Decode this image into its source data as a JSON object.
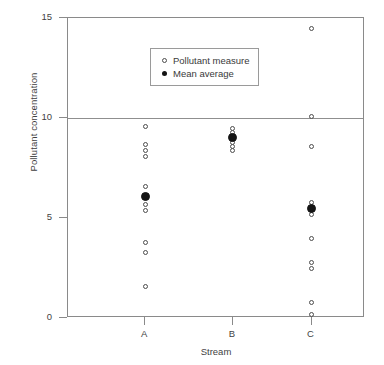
{
  "chart_data": {
    "type": "scatter",
    "title": "",
    "xlabel": "Stream",
    "ylabel": "Pollutant concentration",
    "categories": [
      "A",
      "B",
      "C"
    ],
    "yticks": [
      0,
      5,
      10,
      15
    ],
    "ylim": [
      0,
      15
    ],
    "grid": false,
    "reference_lines": [
      10
    ],
    "legend": {
      "position": "top-left-inside",
      "entries": [
        {
          "label": "Pollutant measure",
          "marker": "open-circle",
          "color": "#4c4c4c"
        },
        {
          "label": "Mean average",
          "marker": "filled-circle",
          "color": "#141414"
        }
      ]
    },
    "series": [
      {
        "name": "Pollutant measure",
        "marker": "open-circle",
        "points": [
          {
            "category": "A",
            "value": 9.6
          },
          {
            "category": "A",
            "value": 8.7
          },
          {
            "category": "A",
            "value": 8.4
          },
          {
            "category": "A",
            "value": 8.1
          },
          {
            "category": "A",
            "value": 6.6
          },
          {
            "category": "A",
            "value": 5.7
          },
          {
            "category": "A",
            "value": 5.4
          },
          {
            "category": "A",
            "value": 3.8
          },
          {
            "category": "A",
            "value": 3.3
          },
          {
            "category": "A",
            "value": 1.6
          },
          {
            "category": "B",
            "value": 9.5
          },
          {
            "category": "B",
            "value": 9.3
          },
          {
            "category": "B",
            "value": 9.1
          },
          {
            "category": "B",
            "value": 8.8
          },
          {
            "category": "B",
            "value": 8.6
          },
          {
            "category": "B",
            "value": 8.4
          },
          {
            "category": "C",
            "value": 14.5
          },
          {
            "category": "C",
            "value": 10.1
          },
          {
            "category": "C",
            "value": 8.6
          },
          {
            "category": "C",
            "value": 5.8
          },
          {
            "category": "C",
            "value": 5.2
          },
          {
            "category": "C",
            "value": 4.0
          },
          {
            "category": "C",
            "value": 2.8
          },
          {
            "category": "C",
            "value": 2.5
          },
          {
            "category": "C",
            "value": 0.8
          },
          {
            "category": "C",
            "value": 0.2
          }
        ]
      },
      {
        "name": "Mean average",
        "marker": "filled-circle",
        "points": [
          {
            "category": "A",
            "value": 6.1
          },
          {
            "category": "B",
            "value": 9.05
          },
          {
            "category": "C",
            "value": 5.5
          }
        ]
      }
    ]
  }
}
